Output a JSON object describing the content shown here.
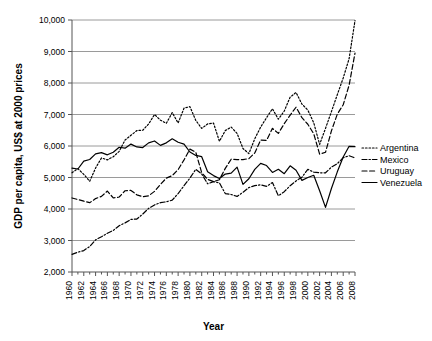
{
  "chart_data": {
    "type": "line",
    "title": "",
    "xlabel": "Year",
    "ylabel": "GDP per capita, US$ at 2000 prices",
    "xlim": [
      1960,
      2008
    ],
    "ylim": [
      2000,
      10000
    ],
    "ytick_step": 1000,
    "xtick_step": 2,
    "grid": "horizontal",
    "legend_position": "right",
    "ytick_labels": [
      "2,000",
      "3,000",
      "4,000",
      "5,000",
      "6,000",
      "7,000",
      "8,000",
      "9,000",
      "10,000"
    ],
    "ytick_values": [
      2000,
      3000,
      4000,
      5000,
      6000,
      7000,
      8000,
      9000,
      10000
    ],
    "xtick_labels": [
      "1960",
      "1962",
      "1964",
      "1966",
      "1968",
      "1970",
      "1972",
      "1974",
      "1976",
      "1978",
      "1980",
      "1982",
      "1984",
      "1986",
      "1988",
      "1990",
      "1992",
      "1994",
      "1996",
      "1998",
      "2000",
      "2002",
      "2004",
      "2006",
      "2008"
    ],
    "x": [
      1960,
      1961,
      1962,
      1963,
      1964,
      1965,
      1966,
      1967,
      1968,
      1969,
      1970,
      1971,
      1972,
      1973,
      1974,
      1975,
      1976,
      1977,
      1978,
      1979,
      1980,
      1981,
      1982,
      1983,
      1984,
      1985,
      1986,
      1987,
      1988,
      1989,
      1990,
      1991,
      1992,
      1993,
      1994,
      1995,
      1996,
      1997,
      1998,
      1999,
      2000,
      2001,
      2002,
      2003,
      2004,
      2005,
      2006,
      2007,
      2008
    ],
    "series": [
      {
        "name": "Argentina",
        "style": "dotted",
        "values": [
          5150,
          5280,
          5100,
          4880,
          5300,
          5620,
          5560,
          5660,
          5830,
          6190,
          6340,
          6490,
          6500,
          6700,
          7000,
          6820,
          6720,
          7060,
          6730,
          7200,
          7250,
          6810,
          6560,
          6700,
          6730,
          6150,
          6490,
          6600,
          6400,
          5920,
          5760,
          6230,
          6600,
          6900,
          7180,
          6850,
          7110,
          7550,
          7700,
          7330,
          7140,
          6740,
          6050,
          6560,
          7090,
          7630,
          8160,
          8770,
          9980
        ]
      },
      {
        "name": "Mexico",
        "style": "dash-dot",
        "values": [
          2560,
          2630,
          2680,
          2810,
          3020,
          3120,
          3230,
          3320,
          3470,
          3560,
          3670,
          3680,
          3840,
          4020,
          4130,
          4200,
          4230,
          4280,
          4490,
          4740,
          4980,
          5260,
          5110,
          4800,
          4870,
          4830,
          4490,
          4460,
          4400,
          4530,
          4680,
          4740,
          4770,
          4720,
          4840,
          4420,
          4550,
          4740,
          4890,
          5010,
          5260,
          5170,
          5150,
          5150,
          5330,
          5440,
          5630,
          5690,
          5620
        ]
      },
      {
        "name": "Uruguay",
        "style": "dashed",
        "values": [
          4350,
          4300,
          4250,
          4200,
          4330,
          4400,
          4570,
          4350,
          4380,
          4580,
          4590,
          4450,
          4390,
          4420,
          4560,
          4780,
          4980,
          5060,
          5250,
          5560,
          5900,
          5800,
          5150,
          4940,
          4870,
          4930,
          5290,
          5580,
          5570,
          5570,
          5600,
          5780,
          6190,
          6180,
          6560,
          6400,
          6710,
          6980,
          7230,
          6900,
          6690,
          6390,
          5740,
          5800,
          6480,
          7010,
          7310,
          7930,
          8950
        ]
      },
      {
        "name": "Venezuela",
        "style": "solid",
        "values": [
          5300,
          5270,
          5520,
          5570,
          5750,
          5790,
          5720,
          5800,
          5960,
          5930,
          6060,
          5970,
          5950,
          6100,
          6160,
          6020,
          6100,
          6230,
          6120,
          6060,
          5810,
          5700,
          5660,
          5180,
          5060,
          4970,
          5110,
          5140,
          5330,
          4780,
          4960,
          5260,
          5450,
          5380,
          5160,
          5260,
          5120,
          5370,
          5230,
          4910,
          5000,
          5070,
          4580,
          4050,
          4650,
          5180,
          5650,
          5990,
          5980
        ]
      }
    ]
  },
  "legend": {
    "items": [
      {
        "label": "Argentina"
      },
      {
        "label": "Mexico"
      },
      {
        "label": "Uruguay"
      },
      {
        "label": "Venezuela"
      }
    ]
  }
}
